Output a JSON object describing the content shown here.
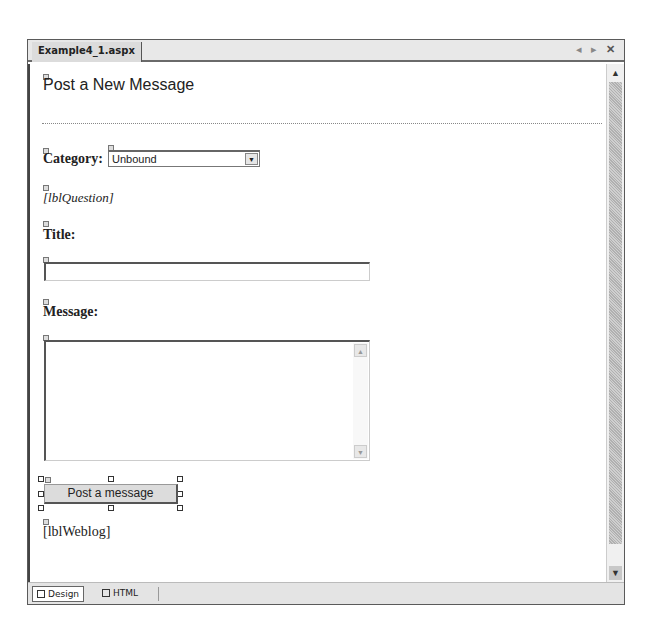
{
  "window": {
    "doc_tab": "Example4_1.aspx",
    "controls": {
      "prev_icon": "◂",
      "next_icon": "▸",
      "close_icon": "✕"
    }
  },
  "page": {
    "heading": "Post a New Message",
    "category_label": "Category:",
    "category_select_value": "Unbound",
    "question_label": "[lblQuestion]",
    "title_label": "Title:",
    "title_value": "",
    "message_label": "Message:",
    "message_value": "",
    "submit_button": "Post a message",
    "weblog_label": "[lblWeblog]"
  },
  "view_tabs": [
    {
      "label": "Design",
      "active": true
    },
    {
      "label": "HTML",
      "active": false
    }
  ],
  "scrollbar": {
    "up_icon": "▲",
    "down_icon": "▼"
  }
}
